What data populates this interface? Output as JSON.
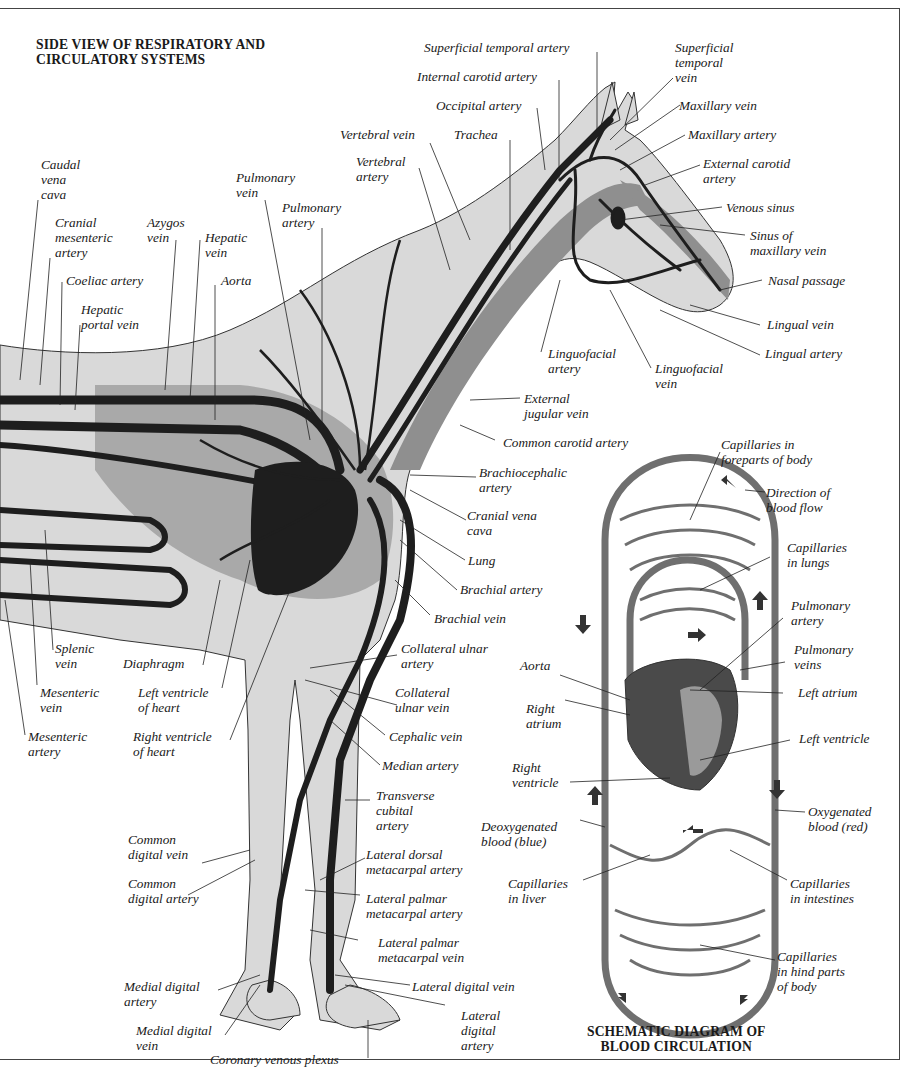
{
  "titles": {
    "main": "SIDE VIEW OF RESPIRATORY AND\nCIRCULATORY SYSTEMS",
    "schematic": "SCHEMATIC DIAGRAM OF\nBLOOD CIRCULATION"
  },
  "colors": {
    "body_fill": "#d9d9d9",
    "vessel": "#1e1e1e",
    "organ_mid": "#8f8f8f",
    "lung": "#a9a9a9",
    "schematic_vessel": "#6f6f6f",
    "heart": "#4a4a4a",
    "outline": "#333333"
  },
  "labels": {
    "superficial_temporal_artery": "Superficial temporal artery",
    "internal_carotid_artery": "Internal carotid artery",
    "occipital_artery": "Occipital artery",
    "trachea": "Trachea",
    "vertebral_vein": "Vertebral vein",
    "vertebral_artery": "Vertebral\nartery",
    "superficial_temporal_vein": "Superficial\ntemporal\nvein",
    "maxillary_vein": "Maxillary vein",
    "maxillary_artery": "Maxillary artery",
    "external_carotid_artery": "External carotid\nartery",
    "venous_sinus": "Venous sinus",
    "sinus_of_maxillary_vein": "Sinus of\nmaxillary vein",
    "nasal_passage": "Nasal passage",
    "lingual_vein": "Lingual vein",
    "lingual_artery": "Lingual artery",
    "linguofacial_artery": "Linguofacial\nartery",
    "linguofacial_vein": "Linguofacial\nvein",
    "external_jugular_vein": "External\njugular vein",
    "common_carotid_artery": "Common carotid artery",
    "brachiocephalic_artery": "Brachiocephalic\nartery",
    "cranial_vena_cava": "Cranial vena\ncava",
    "lung": "Lung",
    "brachial_artery": "Brachial artery",
    "brachial_vein": "Brachial vein",
    "caudal_vena_cava": "Caudal\nvena\ncava",
    "cranial_mesenteric_artery": "Cranial\nmesenteric\nartery",
    "azygos_vein": "Azygos\nvein",
    "hepatic_vein": "Hepatic\nvein",
    "pulmonary_vein": "Pulmonary\nvein",
    "pulmonary_artery": "Pulmonary\nartery",
    "coeliac_artery": "Coeliac artery",
    "aorta": "Aorta",
    "hepatic_portal_vein": "Hepatic\nportal vein",
    "splenic_vein": "Splenic\nvein",
    "diaphragm": "Diaphragm",
    "mesenteric_vein": "Mesenteric\nvein",
    "left_ventricle_of_heart": "Left ventricle\nof heart",
    "mesenteric_artery": "Mesenteric\nartery",
    "right_ventricle_of_heart": "Right ventricle\nof heart",
    "collateral_ulnar_artery": "Collateral ulnar\nartery",
    "collateral_ulnar_vein": "Collateral\nulnar vein",
    "cephalic_vein": "Cephalic vein",
    "median_artery": "Median artery",
    "transverse_cubital_artery": "Transverse\ncubital\nartery",
    "common_digital_vein": "Common\ndigital vein",
    "common_digital_artery": "Common\ndigital artery",
    "lateral_dorsal_metacarpal_artery": "Lateral dorsal\nmetacarpal artery",
    "lateral_palmar_metacarpal_artery": "Lateral palmar\nmetacarpal artery",
    "lateral_palmar_metacarpal_vein": "Lateral palmar\nmetacarpal vein",
    "medial_digital_artery": "Medial digital\nartery",
    "lateral_digital_vein": "Lateral digital vein",
    "medial_digital_vein": "Medial digital\nvein",
    "lateral_digital_artery": "Lateral\ndigital\nartery",
    "coronary_venous_plexus": "Coronary venous plexus"
  },
  "schematic_labels": {
    "capillaries_foreparts": "Capillaries in\nforeparts of body",
    "direction_of_blood_flow": "Direction of\nblood flow",
    "capillaries_lungs": "Capillaries\nin lungs",
    "pulmonary_artery": "Pulmonary\nartery",
    "pulmonary_veins": "Pulmonary\nveins",
    "aorta": "Aorta",
    "left_atrium": "Left atrium",
    "right_atrium": "Right\natrium",
    "left_ventricle": "Left ventricle",
    "right_ventricle": "Right\nventricle",
    "oxygenated_blood": "Oxygenated\nblood (red)",
    "deoxygenated_blood": "Deoxygenated\nblood (blue)",
    "capillaries_liver": "Capillaries\nin liver",
    "capillaries_intestines": "Capillaries\nin intestines",
    "capillaries_hind_parts": "Capillaries\nin hind parts\nof body"
  }
}
